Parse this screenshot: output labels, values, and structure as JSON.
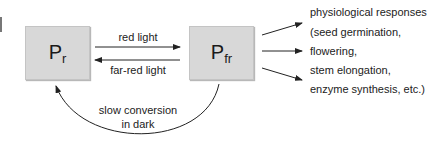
{
  "diagram": {
    "nodes": {
      "pr": {
        "main": "P",
        "sub": "r"
      },
      "pfr": {
        "main": "P",
        "sub": "fr"
      }
    },
    "edges": {
      "forward_label": "red light",
      "reverse_label": "far-red light",
      "dark_label_line1": "slow conversion",
      "dark_label_line2": "in dark"
    },
    "responses": [
      "physiological responses",
      "(seed germination,",
      "flowering,",
      "stem elongation,",
      "enzyme synthesis, etc.)"
    ],
    "colors": {
      "box_fill": "#d8d8d8",
      "line": "#222222",
      "text": "#222222"
    }
  }
}
